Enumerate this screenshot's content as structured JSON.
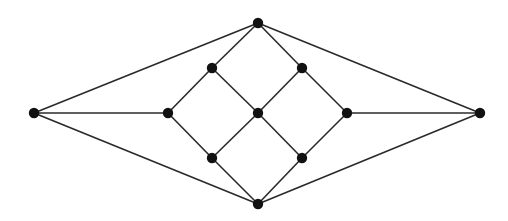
{
  "graph": {
    "nodes": [
      {
        "id": "left"
      },
      {
        "id": "inner-left"
      },
      {
        "id": "upper-left"
      },
      {
        "id": "lower-left"
      },
      {
        "id": "top"
      },
      {
        "id": "center"
      },
      {
        "id": "bottom"
      },
      {
        "id": "upper-right"
      },
      {
        "id": "lower-right"
      },
      {
        "id": "inner-right"
      },
      {
        "id": "right"
      }
    ],
    "edges": [
      [
        "left",
        "top"
      ],
      [
        "left",
        "inner-left"
      ],
      [
        "left",
        "bottom"
      ],
      [
        "top",
        "upper-left"
      ],
      [
        "top",
        "upper-right"
      ],
      [
        "top",
        "right"
      ],
      [
        "upper-left",
        "inner-left"
      ],
      [
        "upper-left",
        "center"
      ],
      [
        "inner-left",
        "lower-left"
      ],
      [
        "lower-left",
        "center"
      ],
      [
        "lower-left",
        "bottom"
      ],
      [
        "center",
        "upper-right"
      ],
      [
        "center",
        "lower-right"
      ],
      [
        "upper-right",
        "inner-right"
      ],
      [
        "lower-right",
        "inner-right"
      ],
      [
        "lower-right",
        "bottom"
      ],
      [
        "inner-right",
        "right"
      ],
      [
        "right",
        "bottom"
      ]
    ]
  }
}
